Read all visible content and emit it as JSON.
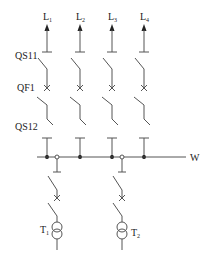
{
  "diagram": {
    "title": "",
    "colors": {
      "line": "#555555",
      "text": "#222222",
      "background": "#ffffff"
    },
    "feeders": [
      {
        "label": "L",
        "sub": "1",
        "x": 47
      },
      {
        "label": "L",
        "sub": "2",
        "x": 80
      },
      {
        "label": "L",
        "sub": "3",
        "x": 112
      },
      {
        "label": "L",
        "sub": "4",
        "x": 144
      }
    ],
    "device_labels": {
      "qs11": "QS11",
      "qf1": "QF1",
      "qs12": "QS12"
    },
    "busbar": {
      "label": "W"
    },
    "transformers": [
      {
        "label": "T",
        "sub": "1",
        "x": 57,
        "label_side": "left"
      },
      {
        "label": "T",
        "sub": "2",
        "x": 122,
        "label_side": "right"
      }
    ]
  }
}
